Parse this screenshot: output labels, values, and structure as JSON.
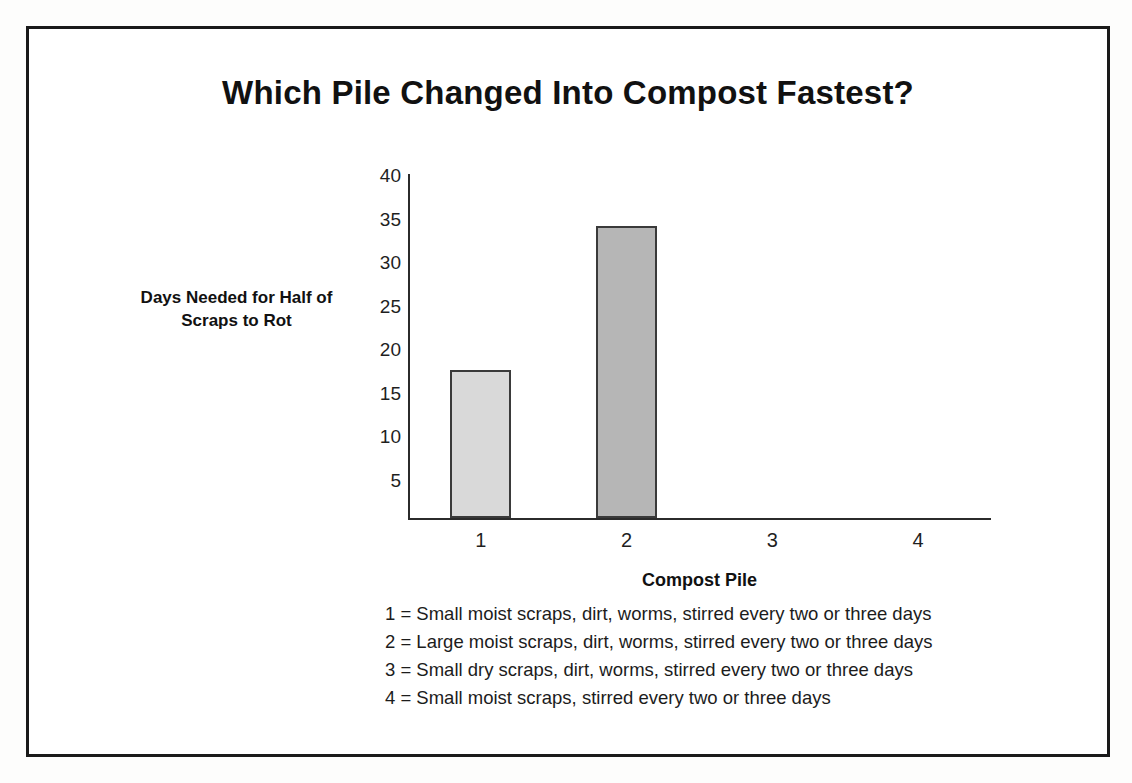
{
  "chart_data": {
    "type": "bar",
    "title": "Which Pile Changed Into Compost Fastest?",
    "xlabel": "Compost Pile",
    "ylabel": "Days Needed for Half of Scraps to Rot",
    "ylabel_lines": [
      "Days Needed for Half of",
      "Scraps to Rot"
    ],
    "categories": [
      "1",
      "2",
      "3",
      "4"
    ],
    "values": [
      18,
      35.5,
      0,
      0
    ],
    "ylim": [
      0,
      42
    ],
    "yticks": [
      40,
      35,
      30,
      25,
      20,
      15,
      10,
      5
    ],
    "ytick_labels": [
      "40",
      "35",
      "30",
      "25",
      "20",
      "15",
      "10",
      "5"
    ],
    "grid": false,
    "legend_position": "below-axis",
    "bar_colors": [
      "#d9d9d9",
      "#b6b6b6",
      "#ffffff",
      "#ffffff"
    ],
    "bar_border_color": "#3a3a3a",
    "axis_color": "#2b2b2b",
    "annotations": [
      "1 = Small moist scraps, dirt, worms, stirred every two or three days",
      "2 = Large moist scraps, dirt, worms, stirred every two or three days",
      "3 = Small dry scraps, dirt, worms, stirred every two or three days",
      "4 = Small moist scraps, stirred every two or three days"
    ]
  },
  "legend": {
    "lines": [
      "1 = Small moist scraps, dirt, worms, stirred every two or three days",
      "2 = Large moist scraps, dirt, worms, stirred every two or three days",
      "3 = Small dry scraps, dirt, worms, stirred every two or three days",
      "4 = Small moist scraps, stirred every two or three days"
    ]
  },
  "colors": {
    "frame": "#1a1a1a",
    "text": "#111111",
    "bar_one": "#d9d9d9",
    "bar_two": "#b6b6b6",
    "background": "#ffffff"
  }
}
